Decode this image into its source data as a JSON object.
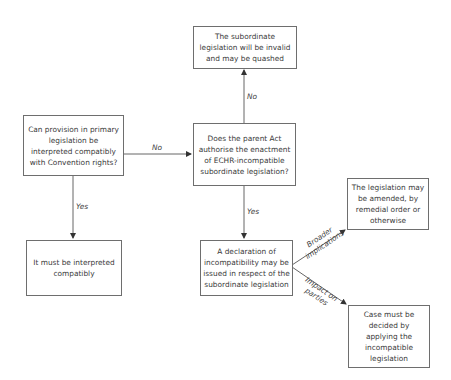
{
  "boxes": {
    "primary_question": "Can provision in primary legislation be interpreted compatibly with Convention rights?",
    "interpret_compatibly": "It must be interpreted compatibly",
    "parent_act_question": "Does the parent Act authorise the enactment of ECHR-incompatible subordinate legislation?",
    "invalid": "The subordinate legislation will be invalid and may be quashed",
    "declaration": "A declaration of incompatibility may be issued in respect of the subordinate legislation",
    "amended": "The legislation may be amended, by remedial order or otherwise",
    "case_decided": "Case must be decided by applying the incompatible legislation"
  },
  "edges": {
    "primary_to_parent": "No",
    "primary_to_interpret": "Yes",
    "parent_to_invalid": "No",
    "parent_to_declaration": "Yes",
    "declaration_to_amended": "Broader implications",
    "declaration_to_case": "Impact on parties"
  }
}
